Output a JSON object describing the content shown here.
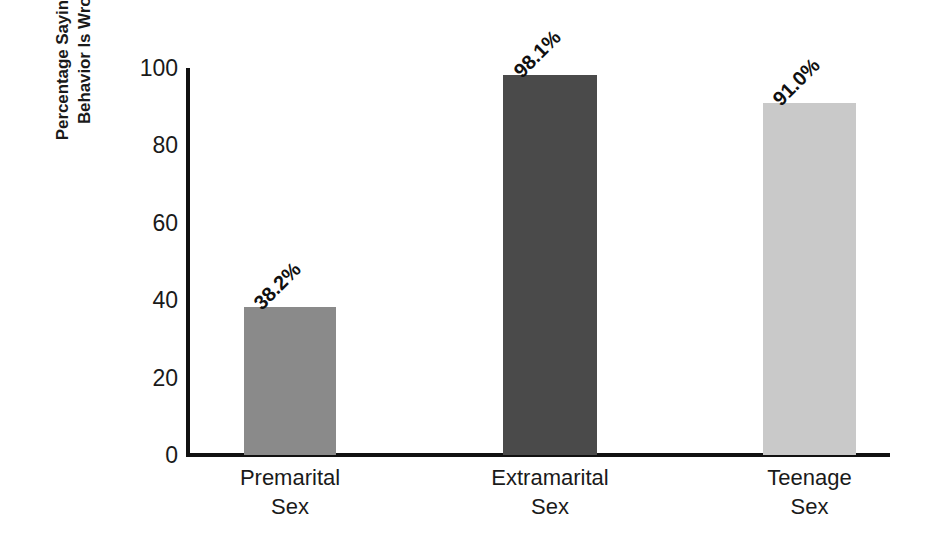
{
  "chart_data": {
    "type": "bar",
    "title": "",
    "subtitle": "",
    "xlabel": "",
    "ylabel": "Percentage Saying the Behavior Is Wrong",
    "ylabel_lines": [
      "Percentage Saying the",
      "Behavior Is Wrong"
    ],
    "categories": [
      "Premarital Sex",
      "Extramarital Sex",
      "Teenage Sex"
    ],
    "category_lines": [
      [
        "Premarital",
        "Sex"
      ],
      [
        "Extramarital",
        "Sex"
      ],
      [
        "Teenage",
        "Sex"
      ]
    ],
    "values": [
      38.2,
      98.1,
      91.0
    ],
    "value_labels": [
      "38.2%",
      "98.1%",
      "91.0%"
    ],
    "ylim": [
      0,
      100
    ],
    "yticks": [
      0,
      20,
      40,
      60,
      80,
      100
    ],
    "ytick_labels": [
      "0",
      "20",
      "40",
      "60",
      "80",
      "100"
    ],
    "grid": false,
    "legend": "none",
    "bar_colors": [
      "#8a8a8a",
      "#4a4a4a",
      "#c9c9c9"
    ],
    "axis_color": "#111111",
    "background": "#ffffff",
    "text_color": "#1a1a1a"
  }
}
